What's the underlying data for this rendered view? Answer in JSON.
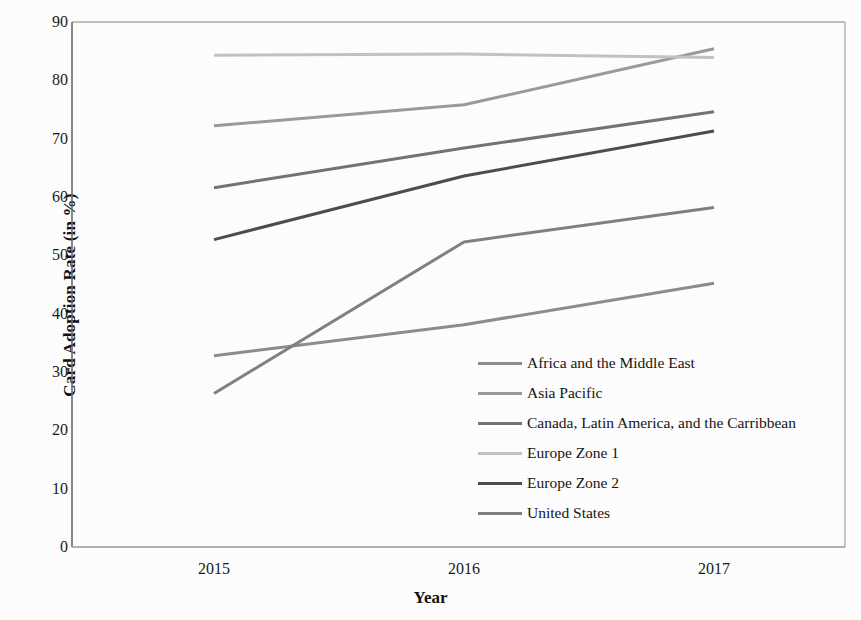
{
  "chart_data": {
    "type": "line",
    "title": "",
    "xlabel": "Year",
    "ylabel": "Card Adoption Rate (in %)",
    "categories": [
      "2015",
      "2016",
      "2017"
    ],
    "x_tick_labels": [
      "2015",
      "2016",
      "2017"
    ],
    "y_tick_labels": [
      "0",
      "10",
      "20",
      "30",
      "40",
      "50",
      "60",
      "70",
      "80",
      "90"
    ],
    "y_ticks": [
      0,
      10,
      20,
      30,
      40,
      50,
      60,
      70,
      80,
      90
    ],
    "ylim": [
      0,
      90
    ],
    "grid": false,
    "legend_position": "inside-lower-right",
    "markers": false,
    "series": [
      {
        "name": "Africa and the Middle East",
        "values": [
          32.8,
          38.1,
          45.2
        ],
        "color": "#8c8c8c"
      },
      {
        "name": "Asia Pacific",
        "values": [
          72.2,
          75.8,
          85.4
        ],
        "color": "#9a9a9a"
      },
      {
        "name": "Canada, Latin America, and the Carribbean",
        "values": [
          61.6,
          68.4,
          74.6
        ],
        "color": "#737373"
      },
      {
        "name": "Europe Zone 1",
        "values": [
          84.3,
          84.5,
          83.9
        ],
        "color": "#c2c2c2"
      },
      {
        "name": "Europe Zone 2",
        "values": [
          52.7,
          63.6,
          71.3
        ],
        "color": "#4d4d4d"
      },
      {
        "name": "United States",
        "values": [
          26.3,
          52.3,
          58.2
        ],
        "color": "#808080"
      }
    ]
  },
  "axes": {
    "frame_color": "#aaaaaa",
    "baseline_color": "#999999"
  }
}
